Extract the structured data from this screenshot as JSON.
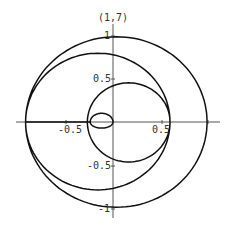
{
  "chart_data": {
    "type": "line",
    "subtype": "parametric-spiral",
    "title": "(1,7)",
    "xlabel": "",
    "ylabel": "",
    "xlim": [
      -0.92,
      1.0
    ],
    "ylim": [
      -1.0,
      1.0
    ],
    "grid": false,
    "legend": null,
    "x_ticks": [
      {
        "value": -0.5,
        "label": "-0.5"
      },
      {
        "value": 0.5,
        "label": "0.5"
      },
      {
        "value": 1,
        "label": ""
      }
    ],
    "y_ticks": [
      {
        "value": 1,
        "label": "1"
      },
      {
        "value": 0.5,
        "label": "0.5"
      },
      {
        "value": -0.5,
        "label": "-0.5"
      },
      {
        "value": -1,
        "label": "-1"
      }
    ],
    "curve_extents": [
      {
        "loop": "outer",
        "top": 0.98,
        "bottom": -0.98,
        "left": -0.92,
        "right": 0.99
      },
      {
        "loop": "second",
        "top": 0.79,
        "bottom": -0.78,
        "left": -0.92,
        "right": 0.6
      },
      {
        "loop": "third",
        "top": 0.45,
        "bottom": -0.46,
        "left": -0.27,
        "right": 0.6
      },
      {
        "loop": "inner",
        "top": 0.1,
        "bottom": -0.07,
        "left": -0.24,
        "right": 0.0
      }
    ],
    "series": [
      {
        "name": "(1,7)",
        "color": "#111111"
      }
    ]
  },
  "labels": {
    "title": "(1,7)",
    "x_neg_half": "-0.5",
    "x_pos_half": "0.5",
    "y_one": "1",
    "y_half": "0.5",
    "y_neg_half": "-0.5",
    "y_neg_one": "-1"
  },
  "colors": {
    "curve": "#111111",
    "axis": "#555555",
    "text": "#333333"
  }
}
